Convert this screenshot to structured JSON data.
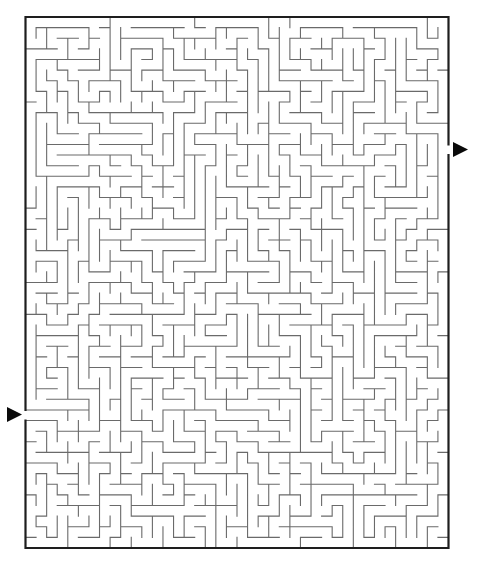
{
  "maze": {
    "cols": 40,
    "rows": 50,
    "origin": {
      "x": 25.5,
      "y": 17
    },
    "cell_width": 10.575,
    "cell_height": 10.62,
    "seed": 73129,
    "entrance": {
      "side": "left",
      "row": 37
    },
    "exit": {
      "side": "right",
      "row": 12
    },
    "colors": {
      "background": "#ffffff",
      "wall": "#6a6a6a",
      "border": "#1e1e1e",
      "arrow": "#0a0a0a"
    }
  },
  "markers": {
    "start_arrow": {
      "icon": "triangle-right-icon",
      "x": 7,
      "y": 414.5,
      "width": 15,
      "height": 15
    },
    "finish_arrow": {
      "icon": "triangle-right-icon",
      "x": 453,
      "y": 149.5,
      "width": 15,
      "height": 15
    }
  }
}
